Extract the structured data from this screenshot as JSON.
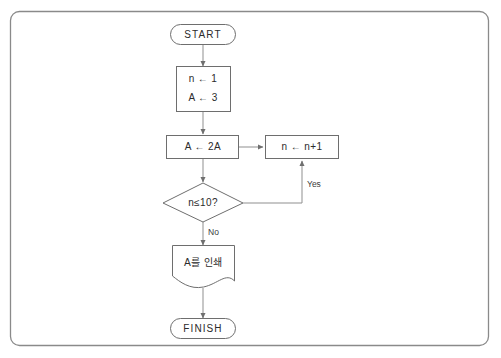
{
  "diagram": {
    "frame": {
      "stroke_color": "#8a8a8a"
    },
    "shape_stroke_color": "#6e6e6e",
    "connector_color": "#8f8f8f",
    "text_color": "#2b2b2b",
    "background_color": "#ffffff",
    "nodes": {
      "start": {
        "label": "START",
        "shape": "terminator"
      },
      "init": {
        "line1": "n ← 1",
        "line2": "A ← 3",
        "shape": "process"
      },
      "double": {
        "label": "A ← 2A",
        "shape": "process"
      },
      "increment": {
        "label": "n ← n+1",
        "shape": "process"
      },
      "decision": {
        "label": "n≤10?",
        "shape": "decision"
      },
      "print": {
        "label": "A를 인쇄",
        "shape": "document"
      },
      "finish": {
        "label": "FINISH",
        "shape": "terminator"
      }
    },
    "edges": {
      "yes_label": "Yes",
      "no_label": "No"
    }
  }
}
